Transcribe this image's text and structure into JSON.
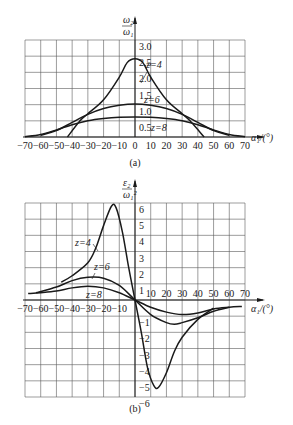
{
  "chart_data": [
    {
      "panel": "a",
      "type": "line",
      "caption": "(a)",
      "ylabel_num": "ω₂",
      "ylabel_den": "ω₁",
      "xlabel": "α₁/(°)",
      "xlim": [
        -70,
        70
      ],
      "ylim": [
        0,
        3.0
      ],
      "xticks": [
        -70,
        -60,
        -50,
        -40,
        -30,
        -20,
        -10,
        0,
        10,
        20,
        30,
        40,
        50,
        60,
        70
      ],
      "yticks": [
        0.5,
        1.0,
        1.5,
        2.0,
        2.5,
        3.0
      ],
      "grid": true,
      "series": [
        {
          "name": "z=4",
          "x": [
            -43,
            -35,
            -30,
            -20,
            -10,
            -5,
            0,
            5,
            10,
            20,
            30,
            35,
            44
          ],
          "y": [
            0,
            0.5,
            0.72,
            1.15,
            1.85,
            2.3,
            2.42,
            2.3,
            1.85,
            1.15,
            0.72,
            0.5,
            0
          ]
        },
        {
          "name": "z=6",
          "x": [
            -60,
            -50,
            -40,
            -30,
            -20,
            -10,
            0,
            10,
            20,
            30,
            40,
            50,
            60
          ],
          "y": [
            0.05,
            0.2,
            0.45,
            0.7,
            0.88,
            0.98,
            1.02,
            0.98,
            0.88,
            0.7,
            0.45,
            0.2,
            0.05
          ]
        },
        {
          "name": "z=8",
          "x": [
            -70,
            -60,
            -50,
            -40,
            -30,
            -20,
            -10,
            0,
            10,
            20,
            30,
            40,
            50,
            60,
            70
          ],
          "y": [
            0.01,
            0.08,
            0.22,
            0.38,
            0.5,
            0.57,
            0.61,
            0.62,
            0.61,
            0.57,
            0.5,
            0.38,
            0.22,
            0.08,
            0.01
          ]
        }
      ]
    },
    {
      "panel": "b",
      "type": "line",
      "caption": "(b)",
      "ylabel_num": "ε₂",
      "ylabel_den": "ω₁²",
      "xlabel": "α₁/(°)",
      "xlim": [
        -70,
        70
      ],
      "ylim": [
        -6,
        6
      ],
      "xticks": [
        -70,
        -60,
        -50,
        -40,
        -30,
        -20,
        -10,
        10,
        20,
        30,
        40,
        50,
        60,
        70
      ],
      "yticks": [
        -6,
        -5,
        -4,
        -3,
        -2,
        -1,
        1,
        2,
        3,
        4,
        5,
        6
      ],
      "grid": true,
      "series": [
        {
          "name": "z=4",
          "x": [
            -47,
            -40,
            -30,
            -25,
            -20,
            -15,
            -12,
            -8,
            -4,
            0,
            4,
            8,
            12,
            15,
            20,
            25,
            30,
            40,
            50
          ],
          "y": [
            1.1,
            1.5,
            2.3,
            3.2,
            4.6,
            5.8,
            5.7,
            4.2,
            2.0,
            0,
            -2.0,
            -4.2,
            -5.3,
            -5.4,
            -4.5,
            -3.2,
            -2.3,
            -1.2,
            -0.5
          ]
        },
        {
          "name": "z=6",
          "x": [
            -63,
            -50,
            -40,
            -30,
            -20,
            -10,
            0,
            10,
            20,
            25,
            30,
            40,
            50,
            60
          ],
          "y": [
            0.45,
            0.8,
            1.2,
            1.4,
            1.35,
            0.9,
            0,
            -0.9,
            -1.4,
            -1.5,
            -1.4,
            -1.1,
            -0.7,
            -0.45
          ]
        },
        {
          "name": "z=8",
          "x": [
            -68,
            -60,
            -50,
            -40,
            -30,
            -20,
            -10,
            0,
            10,
            20,
            30,
            40,
            50,
            60,
            68
          ],
          "y": [
            0.4,
            0.45,
            0.55,
            0.75,
            0.85,
            0.75,
            0.45,
            0,
            -0.45,
            -0.75,
            -0.9,
            -0.8,
            -0.55,
            -0.45,
            -0.4
          ]
        }
      ]
    }
  ]
}
